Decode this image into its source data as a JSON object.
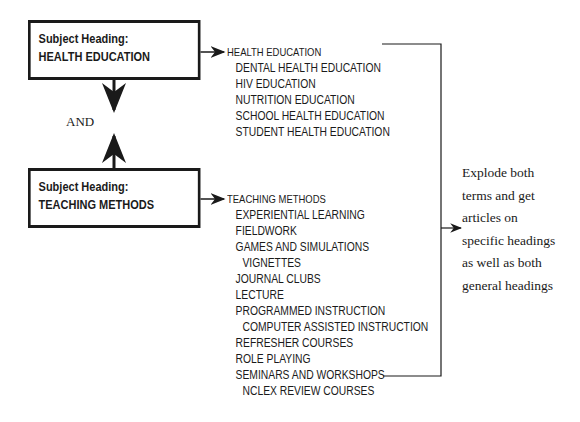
{
  "boxes": {
    "health": {
      "label": "Subject Heading:",
      "term": "HEALTH EDUCATION"
    },
    "teaching": {
      "label": "Subject Heading:",
      "term": "TEACHING METHODS"
    }
  },
  "operator": "AND",
  "health_list": [
    {
      "text": "HEALTH EDUCATION",
      "level": 0
    },
    {
      "text": "DENTAL HEALTH EDUCATION",
      "level": 1
    },
    {
      "text": "HIV EDUCATION",
      "level": 1
    },
    {
      "text": "NUTRITION EDUCATION",
      "level": 1
    },
    {
      "text": "SCHOOL HEALTH EDUCATION",
      "level": 1
    },
    {
      "text": "STUDENT HEALTH EDUCATION",
      "level": 1
    }
  ],
  "teaching_list": [
    {
      "text": "TEACHING METHODS",
      "level": 0
    },
    {
      "text": "EXPERIENTIAL LEARNING",
      "level": 1
    },
    {
      "text": "FIELDWORK",
      "level": 1
    },
    {
      "text": "GAMES AND SIMULATIONS",
      "level": 1
    },
    {
      "text": "VIGNETTES",
      "level": 2
    },
    {
      "text": "JOURNAL CLUBS",
      "level": 1
    },
    {
      "text": "LECTURE",
      "level": 1
    },
    {
      "text": "PROGRAMMED INSTRUCTION",
      "level": 1
    },
    {
      "text": "COMPUTER ASSISTED INSTRUCTION",
      "level": 2
    },
    {
      "text": "REFRESHER COURSES",
      "level": 1
    },
    {
      "text": "ROLE PLAYING",
      "level": 1
    },
    {
      "text": "SEMINARS AND WORKSHOPS",
      "level": 1
    },
    {
      "text": "NCLEX REVIEW COURSES",
      "level": 2
    }
  ],
  "note": {
    "lines": [
      "Explode both",
      "terms and get",
      "articles on",
      "specific headings",
      "as well as both",
      "general headings"
    ]
  }
}
